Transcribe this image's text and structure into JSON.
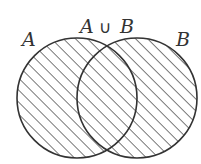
{
  "diagram": {
    "type": "venn",
    "title": "A ∪ B",
    "sets": [
      {
        "id": "A",
        "label": "A",
        "cx": 77,
        "cy": 98,
        "r": 60
      },
      {
        "id": "B",
        "label": "B",
        "cx": 137,
        "cy": 98,
        "r": 60
      }
    ],
    "union_label": {
      "left": "A",
      "operator": "∪",
      "right": "B"
    },
    "shaded_region": "A ∪ B",
    "hatch": {
      "angle": 45,
      "spacing": 8.5
    },
    "colors": {
      "stroke": "#333333",
      "background": "#ffffff"
    }
  }
}
